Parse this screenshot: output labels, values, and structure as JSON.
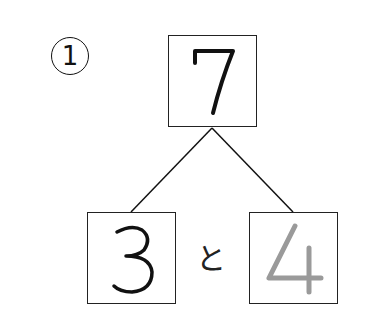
{
  "problem": {
    "number_label": "1",
    "whole": "7",
    "part_left": "3",
    "part_right": "4",
    "connector": "と",
    "part_right_style": "traced-gray",
    "colors": {
      "ink": "#111111",
      "traced": "#9a9a9a"
    }
  }
}
